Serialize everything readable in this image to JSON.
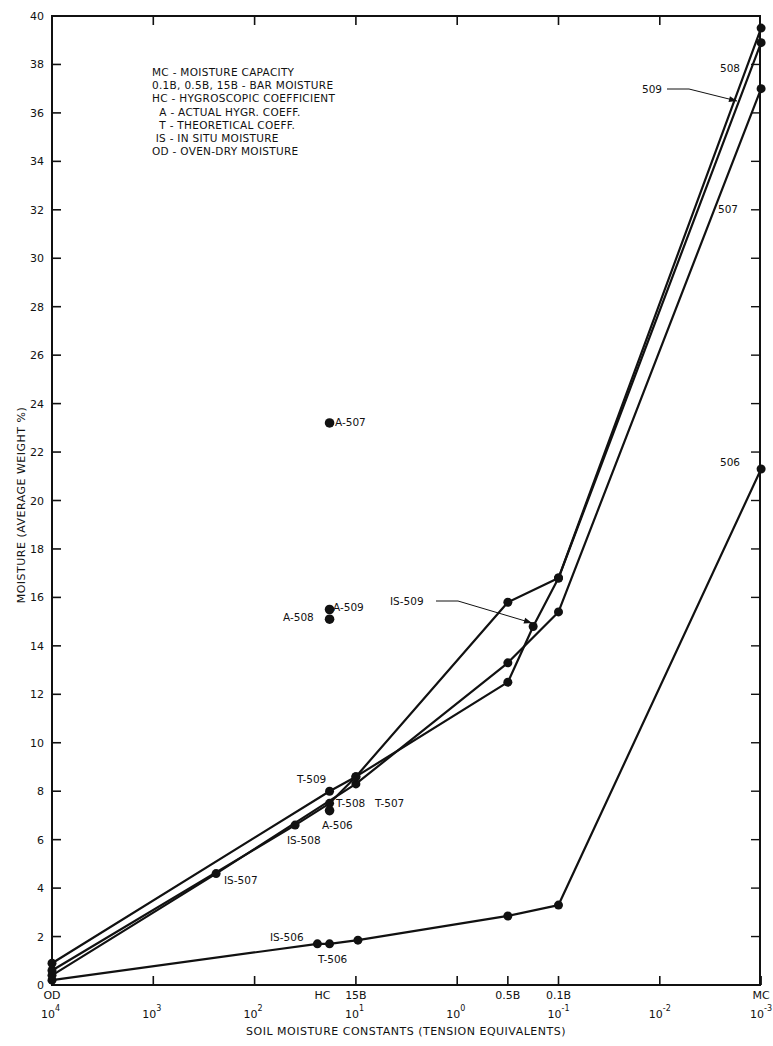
{
  "chart_data": {
    "type": "line",
    "title": "",
    "xlabel": "SOIL MOISTURE CONSTANTS (TENSION EQUIVALENTS)",
    "ylabel": "MOISTURE (AVERAGE WEIGHT %)",
    "ylim": [
      0,
      40
    ],
    "y_ticks": [
      0,
      2,
      4,
      6,
      8,
      10,
      12,
      14,
      16,
      18,
      20,
      22,
      24,
      26,
      28,
      30,
      32,
      34,
      36,
      38,
      40
    ],
    "x_scale": "log (reversed)",
    "x_ticks": [
      {
        "pos": 4,
        "label": "10",
        "exp": "4",
        "top": "OD"
      },
      {
        "pos": 3,
        "label": "10",
        "exp": "3",
        "top": ""
      },
      {
        "pos": 2,
        "label": "10",
        "exp": "2",
        "top": ""
      },
      {
        "pos": 1,
        "label": "10",
        "exp": "1",
        "top": ""
      },
      {
        "pos": 0,
        "label": "10",
        "exp": "0",
        "top": ""
      },
      {
        "pos": -0.5,
        "label": "",
        "exp": "",
        "top": "0.5B"
      },
      {
        "pos": -1,
        "label": "10",
        "exp": "-1",
        "top": "0.1B"
      },
      {
        "pos": -2,
        "label": "10",
        "exp": "-2",
        "top": ""
      },
      {
        "pos": -3,
        "label": "10",
        "exp": "-3",
        "top": "MC"
      }
    ],
    "x_extra_labels": [
      {
        "pos": 1.33,
        "text": "HC"
      },
      {
        "pos": 1.0,
        "text": "15B"
      }
    ],
    "grid": false,
    "legend": {
      "position": "top-left",
      "entries": [
        "MC - MOISTURE CAPACITY",
        "0.1B, 0.5B, 15B - BAR MOISTURE",
        "HC - HYGROSCOPIC COEFFICIENT",
        "  A - ACTUAL HYGR. COEFF.",
        "  T - THEORETICAL COEFF.",
        " IS - IN SITU MOISTURE",
        "OD - OVEN-DRY MOISTURE"
      ]
    },
    "series": [
      {
        "name": "506",
        "points": [
          {
            "x": 4,
            "y": 0.2,
            "label": "OD"
          },
          {
            "x": 1.38,
            "y": 1.7,
            "label": "IS-506"
          },
          {
            "x": 1.26,
            "y": 1.7,
            "label": "T-506"
          },
          {
            "x": 0.98,
            "y": 1.85,
            "label": "15B"
          },
          {
            "x": -0.5,
            "y": 2.85,
            "label": "0.5B"
          },
          {
            "x": -1,
            "y": 3.3,
            "label": "0.1B"
          },
          {
            "x": -3,
            "y": 21.3,
            "label": "MC"
          }
        ]
      },
      {
        "name": "507",
        "points": [
          {
            "x": 4,
            "y": 0.4,
            "label": "OD"
          },
          {
            "x": 2.38,
            "y": 4.6,
            "label": "IS-507"
          },
          {
            "x": 1.0,
            "y": 8.3,
            "label": "T-507 / 15B"
          },
          {
            "x": -0.5,
            "y": 13.3,
            "label": "0.5B"
          },
          {
            "x": -1,
            "y": 15.4,
            "label": "0.1B"
          },
          {
            "x": -3,
            "y": 37.0,
            "label": "MC"
          }
        ]
      },
      {
        "name": "508",
        "points": [
          {
            "x": 4,
            "y": 0.6,
            "label": "OD"
          },
          {
            "x": 1.6,
            "y": 6.6,
            "label": "IS-508"
          },
          {
            "x": 1.26,
            "y": 7.5,
            "label": "T-508"
          },
          {
            "x": 1.0,
            "y": 8.6,
            "label": "15B"
          },
          {
            "x": -0.5,
            "y": 15.8,
            "label": "0.5B"
          },
          {
            "x": -1,
            "y": 16.8,
            "label": "0.1B"
          },
          {
            "x": -3,
            "y": 38.9,
            "label": "MC"
          }
        ]
      },
      {
        "name": "509",
        "points": [
          {
            "x": 4,
            "y": 0.9,
            "label": "OD"
          },
          {
            "x": 1.26,
            "y": 8.0,
            "label": "T-509"
          },
          {
            "x": 1.0,
            "y": 8.6,
            "label": "15B"
          },
          {
            "x": -0.5,
            "y": 12.5,
            "label": "0.5B"
          },
          {
            "x": -0.75,
            "y": 14.8,
            "label": "IS-509"
          },
          {
            "x": -1,
            "y": 16.8,
            "label": "0.1B"
          },
          {
            "x": -3,
            "y": 39.5,
            "label": "MC"
          }
        ]
      }
    ],
    "isolated_points": [
      {
        "x": 1.26,
        "y": 23.2,
        "label": "A-507"
      },
      {
        "x": 1.26,
        "y": 15.5,
        "label": "A-509"
      },
      {
        "x": 1.26,
        "y": 15.1,
        "label": "A-508"
      },
      {
        "x": 1.26,
        "y": 7.2,
        "label": "A-506"
      }
    ],
    "annotations": [
      {
        "text": "T-509",
        "px": [
          297,
          783
        ]
      },
      {
        "text": "T-508",
        "px": [
          336,
          807
        ]
      },
      {
        "text": "T-507",
        "px": [
          375,
          807
        ]
      },
      {
        "text": "A-506",
        "px": [
          322,
          829
        ]
      },
      {
        "text": "IS-508",
        "px": [
          287,
          844
        ]
      },
      {
        "text": "IS-507",
        "px": [
          224,
          884
        ]
      },
      {
        "text": "IS-506",
        "px": [
          270,
          941
        ]
      },
      {
        "text": "T-506",
        "px": [
          318,
          963
        ]
      },
      {
        "text": "A-507",
        "px": [
          335,
          426
        ]
      },
      {
        "text": "A-509",
        "px": [
          333,
          611
        ]
      },
      {
        "text": "A-508",
        "px": [
          283,
          621
        ]
      },
      {
        "text": "IS-509",
        "px": [
          390,
          605
        ],
        "arrow_to": [
          532,
          623
        ]
      },
      {
        "text": "509",
        "px": [
          642,
          93
        ],
        "arrow_to": [
          737,
          101
        ]
      },
      {
        "text": "508",
        "px": [
          720,
          72
        ]
      },
      {
        "text": "507",
        "px": [
          718,
          213
        ]
      },
      {
        "text": "506",
        "px": [
          720,
          466
        ]
      }
    ]
  }
}
